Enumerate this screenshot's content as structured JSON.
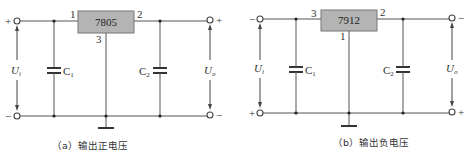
{
  "diagrams": [
    {
      "id": "a",
      "regulator": "7805",
      "pins": {
        "input": "1",
        "output": "2",
        "ground": "3"
      },
      "input_top_polarity": "+",
      "input_bottom_polarity": "−",
      "output_top_polarity": "+",
      "output_bottom_polarity": "−",
      "input_voltage": {
        "main": "U",
        "sub": "i"
      },
      "output_voltage": {
        "main": "U",
        "sub": "o"
      },
      "capacitor_in": {
        "main": "C",
        "sub": "1"
      },
      "capacitor_out": {
        "main": "C",
        "sub": "2"
      },
      "caption": "（a）输出正电压"
    },
    {
      "id": "b",
      "regulator": "7912",
      "pins": {
        "input": "3",
        "output": "2",
        "ground": "1"
      },
      "input_top_polarity": "−",
      "input_bottom_polarity": "+",
      "output_top_polarity": "−",
      "output_bottom_polarity": "+",
      "input_voltage": {
        "main": "U",
        "sub": "i"
      },
      "output_voltage": {
        "main": "U",
        "sub": "o"
      },
      "capacitor_in": {
        "main": "C",
        "sub": "1"
      },
      "capacitor_out": {
        "main": "C",
        "sub": "2"
      },
      "caption": "（b）输出负电压"
    }
  ],
  "colors": {
    "chip_fill": "#b4b4b4",
    "wire": "#555555",
    "background": "#ffffff"
  }
}
